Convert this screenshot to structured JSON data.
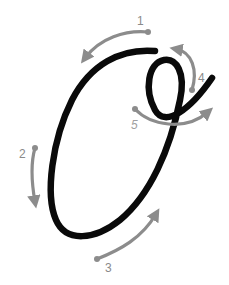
{
  "diagram": {
    "letter": "O",
    "colors": {
      "stroke": "#0a0a0a",
      "arrow": "#8c8c8c",
      "label": "#8a8a8a",
      "background": "#ffffff"
    },
    "steps": [
      {
        "number": "1",
        "direction": "left along top curve"
      },
      {
        "number": "2",
        "direction": "down along left side"
      },
      {
        "number": "3",
        "direction": "up along bottom right"
      },
      {
        "number": "4",
        "direction": "up and around loop"
      },
      {
        "number": "5",
        "direction": "right exit stroke"
      }
    ]
  }
}
